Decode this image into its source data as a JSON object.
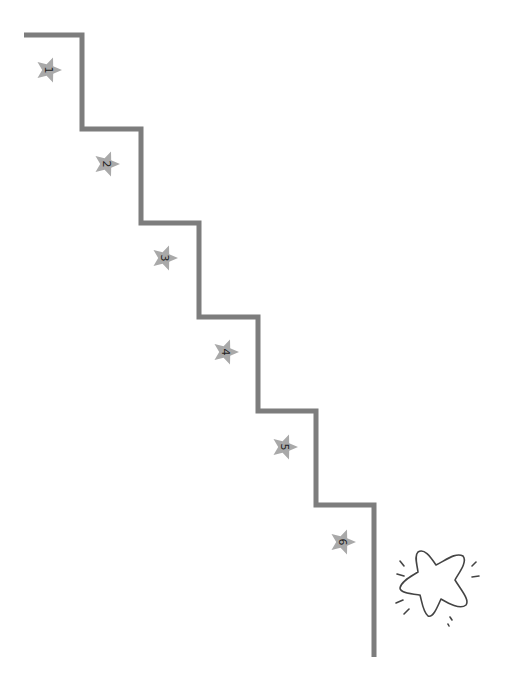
{
  "diagram": {
    "type": "staircase-steps",
    "line_color": "#7d7d7d",
    "star_color": "#a9a9a9",
    "label_color": "#222222",
    "steps": [
      {
        "number": "1",
        "x": 49,
        "y": 70
      },
      {
        "number": "2",
        "x": 107,
        "y": 164
      },
      {
        "number": "3",
        "x": 165,
        "y": 258
      },
      {
        "number": "4",
        "x": 226,
        "y": 352
      },
      {
        "number": "5",
        "x": 285,
        "y": 447
      },
      {
        "number": "6",
        "x": 343,
        "y": 542
      }
    ],
    "goal": {
      "icon": "sparkle-star-outline",
      "x": 438,
      "y": 585
    }
  }
}
